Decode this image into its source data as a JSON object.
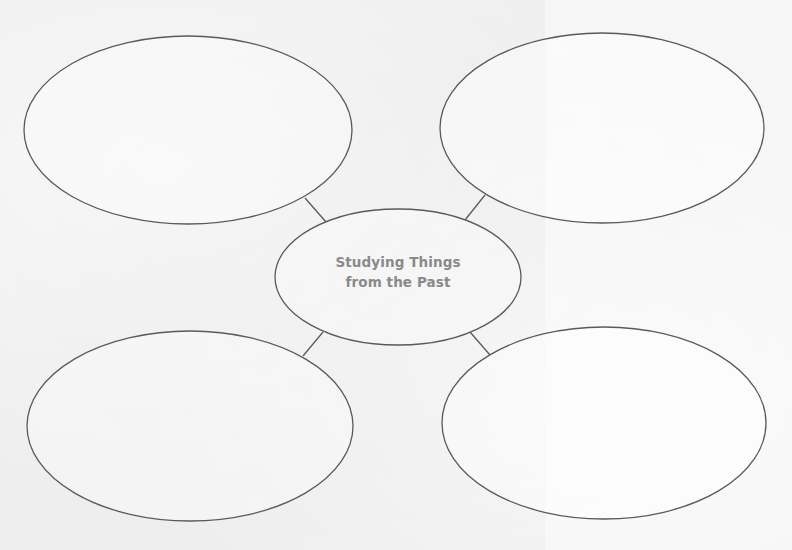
{
  "diagram": {
    "type": "concept-web",
    "center": {
      "line1": "Studying Things",
      "line2": "from the Past",
      "text_color": "#8a8a8a"
    },
    "outer_bubbles": [
      {
        "position": "top-left",
        "text": ""
      },
      {
        "position": "top-right",
        "text": ""
      },
      {
        "position": "bottom-left",
        "text": ""
      },
      {
        "position": "bottom-right",
        "text": ""
      }
    ],
    "colors": {
      "stroke": "#5a5a5a",
      "fill": "#ffffff",
      "background": "#eeeeee"
    }
  }
}
